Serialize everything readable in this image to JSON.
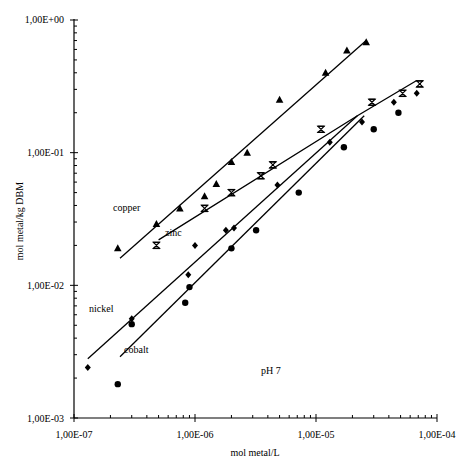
{
  "chart_data": {
    "type": "scatter",
    "title": "",
    "xlabel": "mol metal/L",
    "ylabel": "mol metal/kg DBM",
    "xscale": "log",
    "yscale": "log",
    "xlim": [
      1e-07,
      0.0001
    ],
    "ylim": [
      0.001,
      1
    ],
    "x_tick_labels": [
      "1,00E-07",
      "1,00E-06",
      "1,00E-05",
      "1,00E-04"
    ],
    "y_tick_labels": [
      "1,00E+00",
      "1,00E-01",
      "1,00E-02",
      "1,00E-03"
    ],
    "grid": false,
    "legend": "inline labels",
    "annotation": "pH 7",
    "series": [
      {
        "name": "copper",
        "marker": "triangle",
        "points": [
          [
            2.3e-07,
            0.019
          ],
          [
            4.8e-07,
            0.029
          ],
          [
            7.5e-07,
            0.038
          ],
          [
            1.2e-06,
            0.047
          ],
          [
            1.5e-06,
            0.058
          ],
          [
            2e-06,
            0.085
          ],
          [
            2.7e-06,
            0.1
          ],
          [
            5e-06,
            0.25
          ],
          [
            1.2e-05,
            0.4
          ],
          [
            1.8e-05,
            0.59
          ],
          [
            2.6e-05,
            0.68
          ]
        ],
        "fit_line": [
          [
            2.4e-07,
            0.016
          ],
          [
            2.6e-05,
            0.7
          ]
        ]
      },
      {
        "name": "zinc",
        "marker": "hourglass",
        "points": [
          [
            4.8e-07,
            0.02
          ],
          [
            1.2e-06,
            0.038
          ],
          [
            2e-06,
            0.05
          ],
          [
            3.5e-06,
            0.067
          ],
          [
            4.4e-06,
            0.081
          ],
          [
            1.1e-05,
            0.15
          ],
          [
            2.9e-05,
            0.24
          ],
          [
            5.2e-05,
            0.28
          ],
          [
            7.2e-05,
            0.33
          ]
        ],
        "fit_line": [
          [
            5e-07,
            0.022
          ],
          [
            2.2e-05,
            0.19
          ],
          [
            6.8e-05,
            0.35
          ]
        ]
      },
      {
        "name": "nickel",
        "marker": "diamond",
        "points": [
          [
            1.3e-07,
            0.0024
          ],
          [
            3e-07,
            0.0056
          ],
          [
            8.8e-07,
            0.012
          ],
          [
            1e-06,
            0.02
          ],
          [
            1.8e-06,
            0.026
          ],
          [
            2.1e-06,
            0.027
          ],
          [
            4.8e-06,
            0.057
          ],
          [
            1.3e-05,
            0.12
          ],
          [
            2.4e-05,
            0.17
          ],
          [
            4.4e-05,
            0.24
          ],
          [
            6.8e-05,
            0.28
          ]
        ],
        "fit_line": [
          [
            1.3e-07,
            0.0028
          ],
          [
            2.2e-05,
            0.19
          ]
        ]
      },
      {
        "name": "cobalt",
        "marker": "circle",
        "points": [
          [
            2.3e-07,
            0.0018
          ],
          [
            3e-07,
            0.0051
          ],
          [
            8.3e-07,
            0.0074
          ],
          [
            9e-07,
            0.0097
          ],
          [
            2e-06,
            0.019
          ],
          [
            3.2e-06,
            0.026
          ],
          [
            7.2e-06,
            0.05
          ],
          [
            1.7e-05,
            0.11
          ],
          [
            3e-05,
            0.15
          ],
          [
            4.8e-05,
            0.2
          ]
        ],
        "fit_line": [
          [
            2.4e-07,
            0.0029
          ],
          [
            2.5e-05,
            0.19
          ]
        ]
      }
    ]
  },
  "labels": {
    "copper": "copper",
    "zinc": "zinc",
    "nickel": "nickel",
    "cobalt": "cobalt",
    "ph": "pH 7",
    "xlabel": "mol metal/L",
    "ylabel": "mol metal/kg DBM",
    "xticks": [
      "1,00E-07",
      "1,00E-06",
      "1,00E-05",
      "1,00E-04"
    ],
    "yticks": [
      "1,00E+00",
      "1,00E-01",
      "1,00E-02",
      "1,00E-03"
    ]
  }
}
